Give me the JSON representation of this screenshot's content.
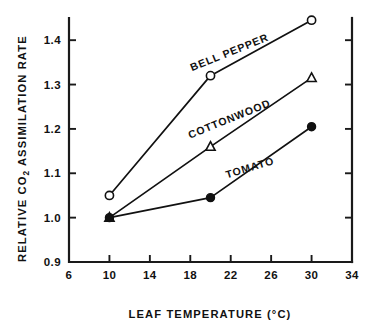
{
  "chart_data": {
    "type": "line",
    "title": "",
    "subtitle": "",
    "xlabel": "LEAF  TEMPERATURE  (°C)",
    "ylabel_prefix": "RELATIVE  CO",
    "ylabel_sub": "2",
    "ylabel_suffix": "  ASSIMILATION  RATE",
    "ylabel_full": "RELATIVE CO2 ASSIMILATION RATE",
    "xlim": [
      6,
      34
    ],
    "ylim": [
      0.9,
      1.45
    ],
    "xticks": [
      6,
      10,
      14,
      18,
      22,
      26,
      30,
      34
    ],
    "xticklabels": [
      "6",
      "10",
      "14",
      "18",
      "22",
      "26",
      "30",
      "34"
    ],
    "yticks": [
      0.9,
      1.0,
      1.1,
      1.2,
      1.3,
      1.4
    ],
    "yticklabels": [
      "0.9",
      "1.0",
      "1.1",
      "1.2",
      "1.3",
      "1.4"
    ],
    "grid": false,
    "legend_position": "inline-annotations",
    "x": [
      10,
      20,
      30
    ],
    "series": [
      {
        "name": "BELL PEPPER",
        "marker": "open-circle",
        "values": [
          1.05,
          1.32,
          1.445
        ],
        "label_x": 22.0,
        "label_y": 1.365,
        "label_angle": -22
      },
      {
        "name": "COTTONWOOD",
        "marker": "open-triangle",
        "values": [
          1.0,
          1.16,
          1.315
        ],
        "label_x": 22.0,
        "label_y": 1.215,
        "label_angle": -22
      },
      {
        "name": "TOMATO",
        "marker": "filled-circle",
        "values": [
          1.0,
          1.045,
          1.205
        ],
        "label_x": 24.0,
        "label_y": 1.105,
        "label_angle": -17
      }
    ]
  }
}
